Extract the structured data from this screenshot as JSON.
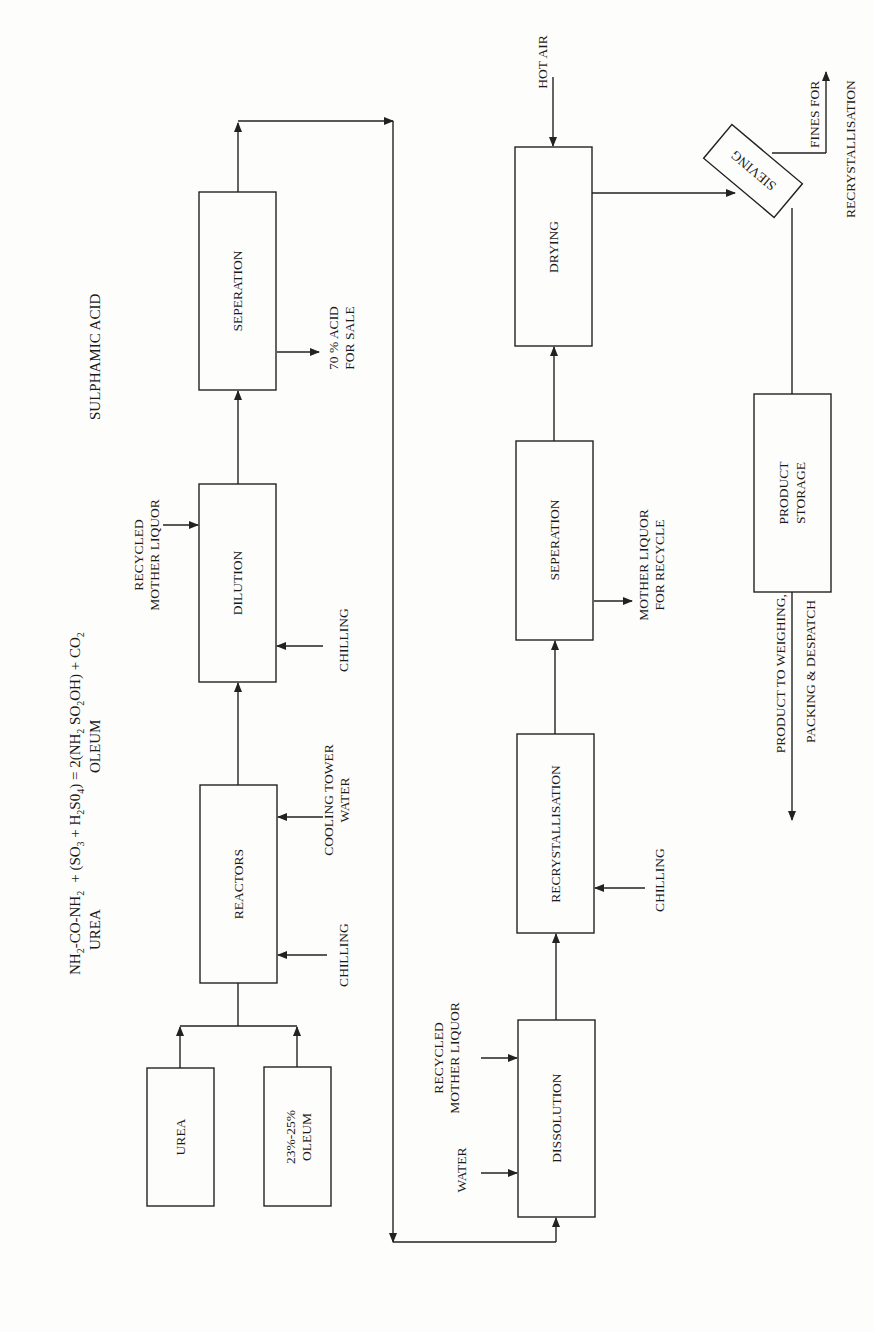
{
  "equation": {
    "line1_parts": {
      "urea_formula": "NH",
      "urea_sub1": "2",
      "urea_mid": "-CO-NH",
      "urea_sub2": "2",
      "plus": "+ (SO",
      "so3_sub": "3",
      "plus_h": " + H",
      "h2_sub": "2",
      "so4": "S0",
      "so4_sub": "4",
      "equals": ") = 2(NH",
      "nh2_sub": "2",
      "so2": " SO",
      "so2_sub": "2",
      "oh": "OH) + CO",
      "co2_sub": "2"
    },
    "under_urea": "UREA",
    "under_oleum": "OLEUM",
    "under_product": "SULPHAMIC ACID"
  },
  "stage1": {
    "boxes": {
      "urea": "UREA",
      "oleum_line1": "23%-25%",
      "oleum_line2": "OLEUM",
      "reactors": "REACTORS",
      "dilution": "DILUTION",
      "separation": "SEPERATION"
    },
    "inputs": {
      "reactor_chilling": "CHILLING",
      "cooling_line1": "COOLING TOWER",
      "cooling_line2": "WATER",
      "dilution_chilling": "CHILLING",
      "recycled_line1": "RECYCLED",
      "recycled_line2": "MOTHER LIQUOR"
    },
    "outputs": {
      "acid_line1": "70 % ACID",
      "acid_line2": "FOR SALE"
    }
  },
  "stage2": {
    "boxes": {
      "dissolution": "DISSOLUTION",
      "recrystallisation": "RECRYSTALLISATION",
      "separation": "SEPERATION",
      "drying": "DRYING",
      "sieving": "SIEVING",
      "storage_line1": "PRODUCT",
      "storage_line2": "STORAGE"
    },
    "inputs": {
      "water": "WATER",
      "recycled_line1": "RECYCLED",
      "recycled_line2": "MOTHER LIQUOR",
      "recryst_chilling": "CHILLING",
      "hot_air": "HOT AIR"
    },
    "outputs": {
      "mother_line1": "MOTHER LIQUOR",
      "mother_line2": "FOR RECYCLE",
      "fines_line1": "FINES FOR",
      "fines_line2": "RECRYSTALLISATION",
      "dispatch_line1": "PRODUCT TO WEIGHING,",
      "dispatch_line2": "PACKING & DESPATCH"
    }
  },
  "colors": {
    "line": "#222222",
    "background": "#fdfdfc",
    "text": "#1a1a1a"
  }
}
